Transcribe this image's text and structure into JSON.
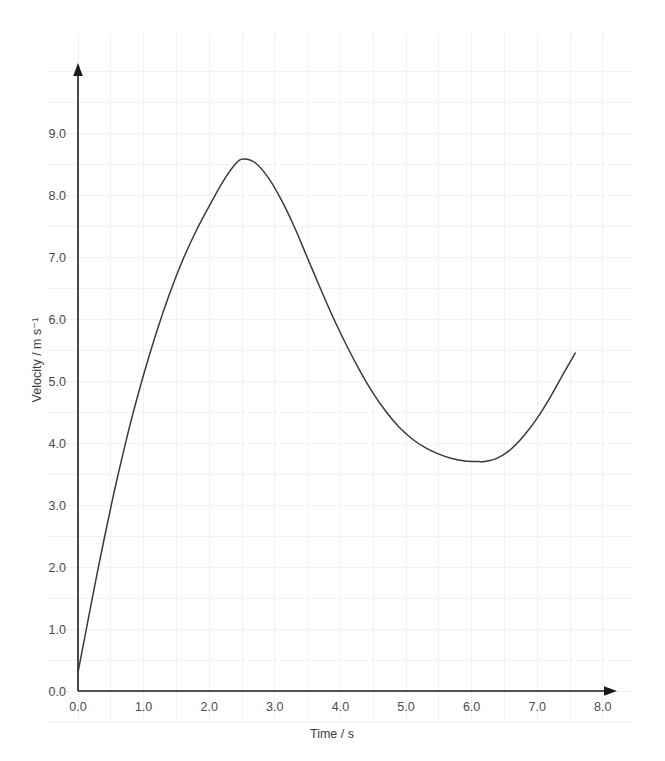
{
  "chart_data": {
    "type": "line",
    "title": "",
    "xlabel": "Time / s",
    "ylabel": "Velocity / m s⁻¹",
    "xlim": [
      0.0,
      8.0
    ],
    "ylim": [
      0.0,
      9.0
    ],
    "xticks": [
      "0.0",
      "1.0",
      "2.0",
      "3.0",
      "4.0",
      "5.0",
      "6.0",
      "7.0",
      "8.0"
    ],
    "xtick_values": [
      0.0,
      1.0,
      2.0,
      3.0,
      4.0,
      5.0,
      6.0,
      7.0,
      8.0
    ],
    "yticks": [
      "0.0",
      "1.0",
      "2.0",
      "3.0",
      "4.0",
      "5.0",
      "6.0",
      "7.0",
      "8.0",
      "9.0"
    ],
    "ytick_values": [
      0.0,
      1.0,
      2.0,
      3.0,
      4.0,
      5.0,
      6.0,
      7.0,
      8.0,
      9.0
    ],
    "grid": true,
    "grid_step": 0.5,
    "legend": null,
    "series": [
      {
        "name": "velocity",
        "color": "#3a3a3a",
        "x": [
          0.0,
          0.1,
          0.2,
          0.3,
          0.4,
          0.5,
          0.6,
          0.8,
          1.0,
          1.2,
          1.4,
          1.6,
          1.8,
          2.0,
          2.2,
          2.4,
          2.52,
          2.7,
          2.9,
          3.1,
          3.3,
          3.5,
          3.7,
          3.9,
          4.1,
          4.3,
          4.5,
          4.7,
          4.9,
          5.1,
          5.3,
          5.5,
          5.7,
          5.9,
          6.1,
          6.2,
          6.4,
          6.6,
          6.8,
          7.0,
          7.2,
          7.4,
          7.58
        ],
        "y": [
          0.3,
          0.85,
          1.4,
          1.94,
          2.46,
          2.96,
          3.44,
          4.32,
          5.1,
          5.8,
          6.42,
          6.96,
          7.42,
          7.82,
          8.2,
          8.5,
          8.58,
          8.52,
          8.28,
          7.92,
          7.48,
          6.98,
          6.48,
          6.0,
          5.56,
          5.16,
          4.8,
          4.5,
          4.25,
          4.06,
          3.92,
          3.82,
          3.75,
          3.71,
          3.7,
          3.7,
          3.76,
          3.9,
          4.12,
          4.4,
          4.74,
          5.12,
          5.45
        ]
      }
    ],
    "annotations": {
      "peak": {
        "x": 2.52,
        "y": 8.58
      },
      "trough": {
        "x": 6.2,
        "y": 3.7
      },
      "start": {
        "x": 0.0,
        "y": 0.3
      },
      "end": {
        "x": 7.58,
        "y": 5.45
      }
    },
    "axis_arrow_x": true,
    "axis_arrow_y": true
  },
  "colors": {
    "background": "#ffffff",
    "grid": "#f2f2f2",
    "axis": "#1b1b1b",
    "curve": "#3a3a3a",
    "text": "#4b4b4b"
  }
}
